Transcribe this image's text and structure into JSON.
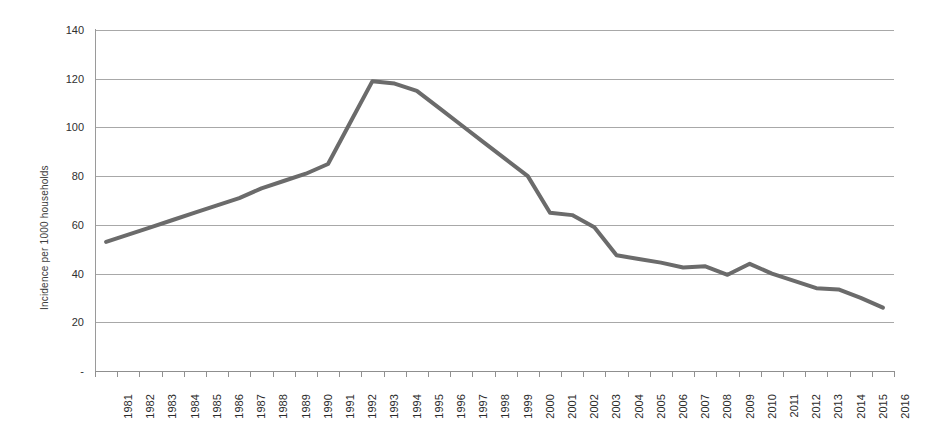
{
  "chart_data": {
    "type": "line",
    "title": "",
    "subtitle": "",
    "xlabel": "",
    "ylabel": "Incidence per 1000 households",
    "xlim": [
      1981,
      2016
    ],
    "ylim": [
      0,
      140
    ],
    "grid": true,
    "legend": "none",
    "y_ticks": [
      "140",
      "120",
      "100",
      "80",
      "60",
      "40",
      "20",
      "-"
    ],
    "y_tick_values": [
      140,
      120,
      100,
      80,
      60,
      40,
      20,
      0
    ],
    "line_color": "#6b6b6b",
    "line_width": 4,
    "categories": [
      "1981",
      "1982",
      "1983",
      "1984",
      "1985",
      "1986",
      "1987",
      "1988",
      "1989",
      "1990",
      "1991",
      "1992",
      "1993",
      "1994",
      "1995",
      "1996",
      "1997",
      "1998",
      "1999",
      "2000",
      "2001",
      "2002",
      "2003",
      "2004",
      "2005",
      "2006",
      "2007",
      "2008",
      "2009",
      "2010",
      "2011",
      "2012",
      "2013",
      "2014",
      "2015",
      "2016"
    ],
    "values": [
      53,
      56,
      59,
      62,
      65,
      68,
      71,
      75,
      78,
      81,
      85,
      102,
      119,
      118,
      115,
      108,
      101,
      94,
      87,
      80,
      65,
      64,
      59,
      47.5,
      46,
      44.5,
      42.5,
      43,
      39.5,
      44,
      40,
      37,
      34,
      33.5,
      30,
      26
    ]
  },
  "axes": {
    "y_title": "Incidence per 1000 households"
  }
}
